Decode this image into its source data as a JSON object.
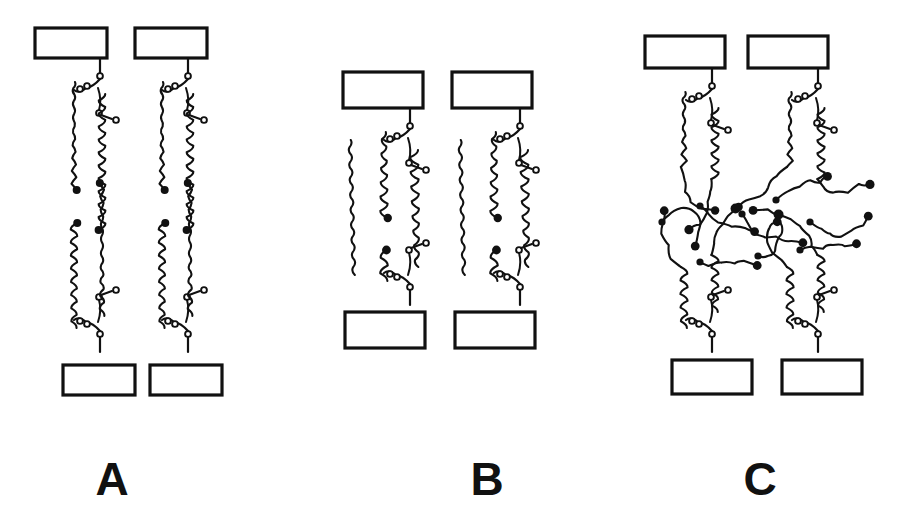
{
  "figure": {
    "background_color": "#ffffff",
    "ink_color": "#111111",
    "width": 899,
    "height": 532
  },
  "panels": [
    {
      "id": "A",
      "label": "A",
      "label_x": 112,
      "label_y": 495,
      "description": "Ordered gel-phase bilayer: fully extended, tightly packed acyl chains spanning between two surfaces",
      "phase": "ordered / gel",
      "top_boxes": [
        {
          "x": 35,
          "y": 28,
          "w": 72,
          "h": 30
        },
        {
          "x": 135,
          "y": 28,
          "w": 72,
          "h": 30
        }
      ],
      "bottom_boxes": [
        {
          "x": 63,
          "y": 365,
          "w": 72,
          "h": 30
        },
        {
          "x": 150,
          "y": 365,
          "w": 72,
          "h": 30
        }
      ],
      "units": [
        {
          "stem_x": 100,
          "head_top_y": 58,
          "head_bot_y": 352,
          "mid_y": 205,
          "flip": false
        },
        {
          "stem_x": 188,
          "head_top_y": 58,
          "head_bot_y": 352,
          "mid_y": 205,
          "flip": false
        }
      ]
    },
    {
      "id": "B",
      "label": "B",
      "label_x": 487,
      "label_y": 495,
      "description": "Intermediate phase: partially disordered chains, outer chain free, bilayer thinner",
      "phase": "intermediate",
      "top_boxes": [
        {
          "x": 343,
          "y": 72,
          "w": 80,
          "h": 36
        },
        {
          "x": 452,
          "y": 72,
          "w": 80,
          "h": 36
        }
      ],
      "bottom_boxes": [
        {
          "x": 345,
          "y": 312,
          "w": 80,
          "h": 36
        },
        {
          "x": 455,
          "y": 312,
          "w": 80,
          "h": 36
        }
      ],
      "units": [
        {
          "stem_x": 410,
          "head_top_y": 108,
          "head_bot_y": 305,
          "mid_y": 208,
          "flip": false
        },
        {
          "stem_x": 520,
          "head_top_y": 108,
          "head_bot_y": 305,
          "mid_y": 208,
          "flip": false
        }
      ]
    },
    {
      "id": "C",
      "label": "C",
      "label_x": 760,
      "label_y": 495,
      "description": "Fluid disordered phase: melted, highly kinked chains filling the membrane interior",
      "phase": "fluid / disordered",
      "top_boxes": [
        {
          "x": 645,
          "y": 36,
          "w": 80,
          "h": 32
        },
        {
          "x": 748,
          "y": 36,
          "w": 80,
          "h": 32
        }
      ],
      "bottom_boxes": [
        {
          "x": 672,
          "y": 360,
          "w": 80,
          "h": 34
        },
        {
          "x": 782,
          "y": 360,
          "w": 80,
          "h": 34
        }
      ],
      "units": [
        {
          "stem_x": 712,
          "head_top_y": 68,
          "head_bot_y": 352,
          "mid_y": 215,
          "flip": false
        },
        {
          "stem_x": 818,
          "head_top_y": 68,
          "head_bot_y": 352,
          "mid_y": 215,
          "flip": false
        }
      ]
    }
  ],
  "legend_semantics": {
    "box": "membrane surface / supporting substrate block",
    "open_circle": "ester oxygen of glycerophospholipid headgroup",
    "wavy_line": "saturated acyl hydrocarbon chain",
    "filled_dot": "terminal methyl group at bilayer midplane"
  }
}
